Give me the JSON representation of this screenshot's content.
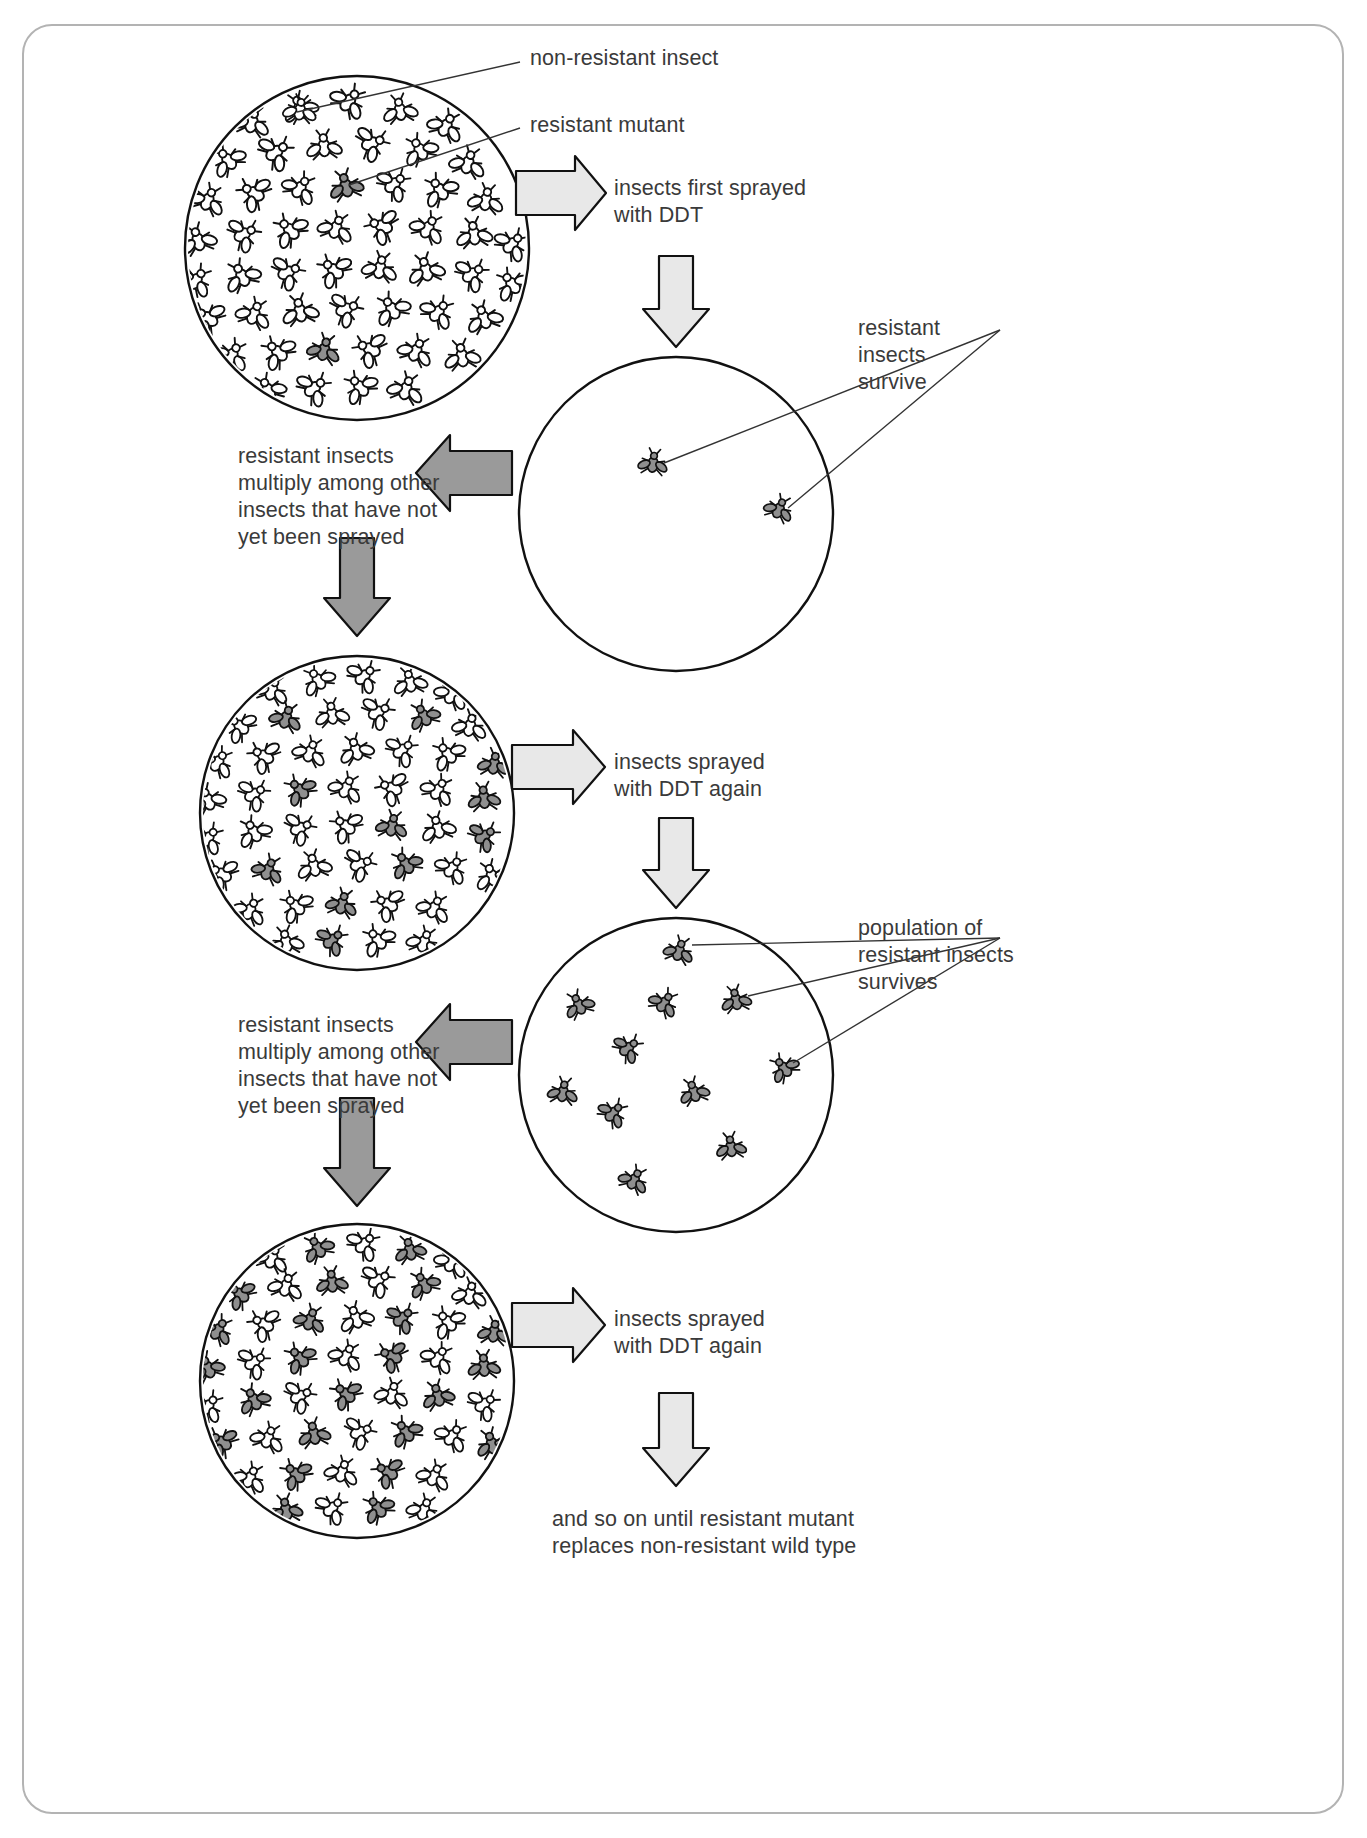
{
  "figure": {
    "domain": "diagram",
    "topic": "Evolution of DDT resistance in an insect population",
    "background": "#ffffff",
    "card_border_color": "#b3b3b3",
    "ink_color": "#1a1a1a",
    "text_color": "#3a3a3a",
    "arrow_light_fill": "#e8e8e8",
    "arrow_dark_fill": "#9a9a9a",
    "resistant_insect_fill": "#8f8f8f",
    "nonresistant_insect_fill": "#ffffff"
  },
  "labels": {
    "non_resistant_insect": "non-resistant insect",
    "resistant_mutant": "resistant mutant",
    "first_spray": "insects first sprayed\nwith DDT",
    "resistant_survive": "resistant\ninsects\nsurvive",
    "multiply_1": "resistant insects\nmultiply among other\ninsects that have not\nyet been sprayed",
    "spray_again_1": "insects sprayed\nwith DDT again",
    "population_survives": "population of\nresistant insects\nsurvives",
    "multiply_2": "resistant insects\nmultiply among other\ninsects that have not\nyet been sprayed",
    "spray_again_2": "insects sprayed\nwith DDT again",
    "conclusion": "and so on until resistant mutant\nreplaces non-resistant wild type"
  },
  "stages": [
    {
      "id": "stage-1",
      "name": "initial-population-dish",
      "center": [
        357,
        248
      ],
      "radius": 172,
      "density": "dense",
      "resistant_count": 2,
      "description": "Dense population of non-resistant insects containing a rare resistant mutant"
    },
    {
      "id": "stage-2",
      "name": "after-first-spray-dish",
      "center": [
        676,
        514
      ],
      "radius": 157,
      "density": "sparse",
      "resistant_count": 2,
      "description": "Only two resistant insects survive the first DDT spray"
    },
    {
      "id": "stage-3",
      "name": "repopulated-dish-1",
      "center": [
        357,
        813
      ],
      "radius": 157,
      "density": "dense",
      "resistant_count": 14,
      "description": "Resistant insects have multiplied among non-resistant insects"
    },
    {
      "id": "stage-4",
      "name": "after-second-spray-dish",
      "center": [
        676,
        1075
      ],
      "radius": 157,
      "density": "sparse",
      "resistant_count": 13,
      "description": "A population of resistant insects survives the second spray"
    },
    {
      "id": "stage-5",
      "name": "repopulated-dish-2",
      "center": [
        357,
        1381
      ],
      "radius": 157,
      "density": "dense",
      "resistant_count": 26,
      "description": "Resistant insects now form a large proportion of the population"
    }
  ],
  "arrows": [
    {
      "name": "arrow-first-spray",
      "direction": "right",
      "style": "light",
      "from": "stage-1",
      "label": "first_spray"
    },
    {
      "name": "arrow-down-to-stage-2",
      "direction": "down",
      "style": "light",
      "to": "stage-2"
    },
    {
      "name": "arrow-multiply-1",
      "direction": "left",
      "style": "dark",
      "from": "stage-2",
      "label": "multiply_1"
    },
    {
      "name": "arrow-down-to-stage-3",
      "direction": "down",
      "style": "dark",
      "to": "stage-3"
    },
    {
      "name": "arrow-spray-again-1",
      "direction": "right",
      "style": "light",
      "from": "stage-3",
      "label": "spray_again_1"
    },
    {
      "name": "arrow-down-to-stage-4",
      "direction": "down",
      "style": "light",
      "to": "stage-4"
    },
    {
      "name": "arrow-multiply-2",
      "direction": "left",
      "style": "dark",
      "from": "stage-4",
      "label": "multiply_2"
    },
    {
      "name": "arrow-down-to-stage-5",
      "direction": "down",
      "style": "dark",
      "to": "stage-5"
    },
    {
      "name": "arrow-spray-again-2",
      "direction": "right",
      "style": "light",
      "from": "stage-5",
      "label": "spray_again_2"
    },
    {
      "name": "arrow-conclusion",
      "direction": "down",
      "style": "light",
      "label": "conclusion"
    }
  ],
  "leaders": [
    {
      "name": "leader-non-resistant-insect",
      "to_label": "non_resistant_insect"
    },
    {
      "name": "leader-resistant-mutant",
      "to_label": "resistant_mutant"
    },
    {
      "name": "leader-resistant-survive-a",
      "to_label": "resistant_survive"
    },
    {
      "name": "leader-resistant-survive-b",
      "to_label": "resistant_survive"
    },
    {
      "name": "leader-population-survives-a",
      "to_label": "population_survives"
    },
    {
      "name": "leader-population-survives-b",
      "to_label": "population_survives"
    },
    {
      "name": "leader-population-survives-c",
      "to_label": "population_survives"
    }
  ]
}
